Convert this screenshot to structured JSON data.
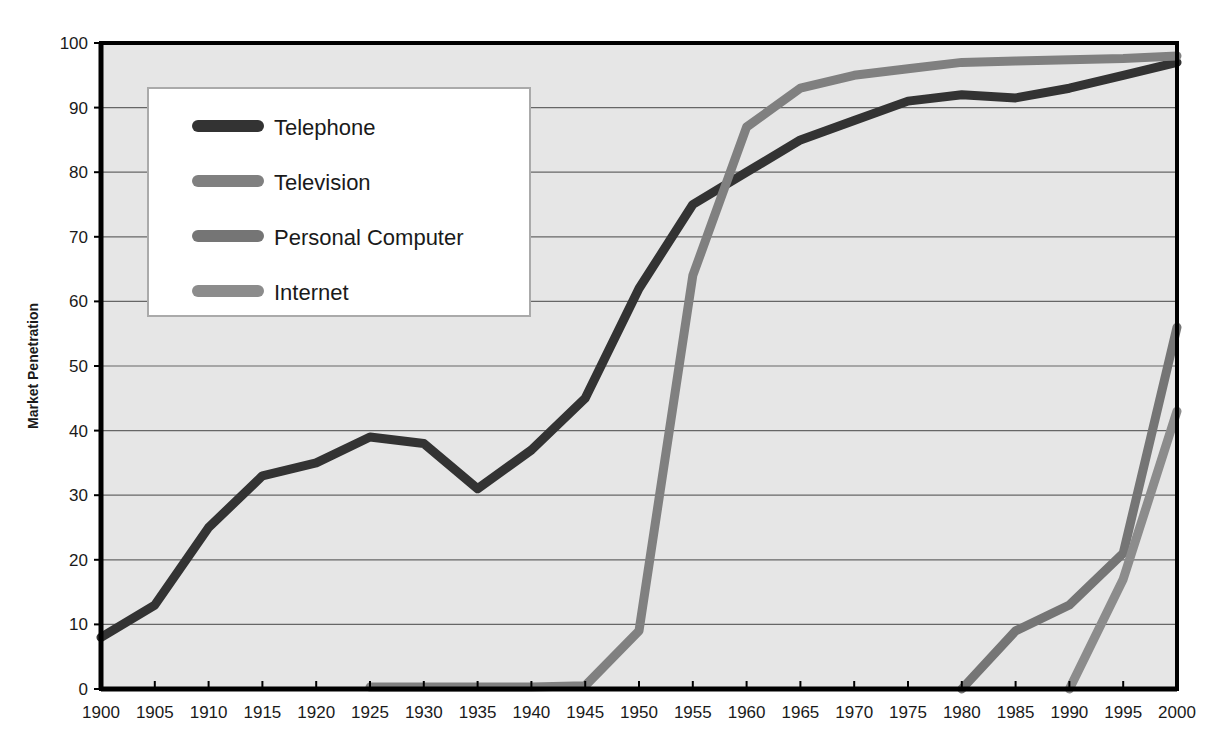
{
  "chart_data": {
    "type": "line",
    "title": "",
    "subtitle": "",
    "xlabel": "",
    "ylabel": "Market Penetration",
    "xlim": [
      1900,
      2000
    ],
    "ylim": [
      0,
      100
    ],
    "grid": true,
    "grid_axis": "y",
    "legend_position": "upper-left-inside",
    "x": [
      1900,
      1905,
      1910,
      1915,
      1920,
      1925,
      1930,
      1935,
      1940,
      1945,
      1950,
      1955,
      1960,
      1965,
      1970,
      1975,
      1980,
      1985,
      1990,
      1995,
      2000
    ],
    "xticklabels": [
      "1900",
      "1905",
      "1910",
      "1915",
      "1920",
      "1925",
      "1930",
      "1935",
      "1940",
      "1945",
      "1950",
      "1955",
      "1960",
      "1965",
      "1970",
      "1975",
      "1980",
      "1985",
      "1990",
      "1995",
      "2000"
    ],
    "yticks": [
      0,
      10,
      20,
      30,
      40,
      50,
      60,
      70,
      80,
      90,
      100
    ],
    "yticklabels": [
      "0",
      "10",
      "20",
      "30",
      "40",
      "50",
      "60",
      "70",
      "80",
      "90",
      "100"
    ],
    "series": [
      {
        "name": "Telephone",
        "color": "#333333",
        "x": [
          1900,
          1905,
          1910,
          1915,
          1920,
          1925,
          1930,
          1935,
          1940,
          1945,
          1950,
          1955,
          1960,
          1965,
          1970,
          1975,
          1980,
          1985,
          1990,
          1995,
          2000
        ],
        "values": [
          8,
          13,
          25,
          33,
          35,
          39,
          38,
          31,
          37,
          45,
          62,
          75,
          80,
          85,
          88,
          91,
          92,
          91.5,
          93,
          95,
          97
        ]
      },
      {
        "name": "Television",
        "color": "#808080",
        "x": [
          1925,
          1930,
          1935,
          1940,
          1945,
          1950,
          1955,
          1960,
          1965,
          1970,
          1975,
          1980,
          1985,
          1990,
          1995,
          2000
        ],
        "values": [
          0.3,
          0.3,
          0.3,
          0.3,
          0.5,
          9,
          64,
          87,
          93,
          95,
          96,
          97,
          97.2,
          97.4,
          97.6,
          98
        ]
      },
      {
        "name": "Personal Computer",
        "color": "#757575",
        "x": [
          1980,
          1985,
          1990,
          1995,
          2000
        ],
        "values": [
          0,
          9,
          13,
          21,
          56
        ]
      },
      {
        "name": "Internet",
        "color": "#8c8c8c",
        "x": [
          1990,
          1995,
          2000
        ],
        "values": [
          0,
          17,
          43
        ]
      }
    ],
    "legend": [
      {
        "label": "Telephone",
        "color": "#333333"
      },
      {
        "label": "Television",
        "color": "#808080"
      },
      {
        "label": "Personal Computer",
        "color": "#757575"
      },
      {
        "label": "Internet",
        "color": "#8c8c8c"
      }
    ],
    "colors": {
      "plot_background": "#e6e6e6",
      "grid": "#666666",
      "axis": "#000000",
      "page_background": "#ffffff",
      "legend_background": "#ffffff",
      "legend_border": "#aaaaaa",
      "text": "#1a1a1a"
    }
  }
}
